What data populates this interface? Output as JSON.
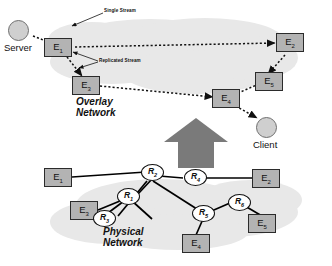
{
  "figure": {
    "overlay": {
      "title": "Overlay Network",
      "title_line1": "Overlay",
      "title_line2": "Network",
      "server_label": "Server",
      "client_label": "Client",
      "annotation_single": "Single Stream",
      "annotation_replicated": "Replicated Stream",
      "nodes": [
        {
          "id": "E1",
          "letter": "E",
          "sub": "1"
        },
        {
          "id": "E2",
          "letter": "E",
          "sub": "2"
        },
        {
          "id": "E3",
          "letter": "E",
          "sub": "3"
        },
        {
          "id": "E4",
          "letter": "E",
          "sub": "4"
        },
        {
          "id": "E5",
          "letter": "E",
          "sub": "5"
        }
      ]
    },
    "physical": {
      "title": "Physical Network",
      "title_line1": "Physical",
      "title_line2": "Network",
      "nodes": [
        {
          "id": "E1",
          "letter": "E",
          "sub": "1"
        },
        {
          "id": "E2",
          "letter": "E",
          "sub": "2"
        },
        {
          "id": "E3",
          "letter": "E",
          "sub": "3"
        },
        {
          "id": "E4",
          "letter": "E",
          "sub": "4"
        },
        {
          "id": "E5",
          "letter": "E",
          "sub": "5"
        }
      ],
      "routers": [
        {
          "id": "R1",
          "letter": "R",
          "sub": "1"
        },
        {
          "id": "R2",
          "letter": "R",
          "sub": "2"
        },
        {
          "id": "R3",
          "letter": "R",
          "sub": "3"
        },
        {
          "id": "R4",
          "letter": "R",
          "sub": "4"
        },
        {
          "id": "R5",
          "letter": "R",
          "sub": "5"
        },
        {
          "id": "R6",
          "letter": "R",
          "sub": "6"
        }
      ]
    },
    "colors": {
      "cloud": "#e8e8e8",
      "node_fill": "#b3b3b3",
      "node_border": "#2b2b2b",
      "host_fill": "#cfcfcf",
      "arrow_gray": "#7a7a7a",
      "link": "#000000"
    },
    "transition_arrow": "up-arrow"
  }
}
